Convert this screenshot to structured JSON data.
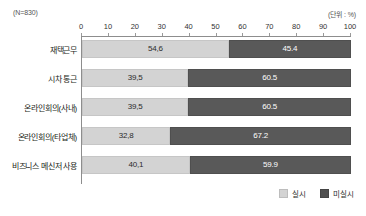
{
  "header": {
    "sample_note": "(N=830)",
    "unit_note": "(단위 : %)"
  },
  "legend": {
    "position": "bottom-right",
    "items": [
      {
        "label": "실시",
        "color": "#d3d3d3"
      },
      {
        "label": "미실시",
        "color": "#4f4f4f"
      }
    ]
  },
  "footnote": {
    "text": ""
  },
  "chart_data": {
    "type": "bar",
    "orientation": "horizontal",
    "stacked": true,
    "stack_total": 100,
    "title": "",
    "subtitle": "",
    "xlabel": "",
    "ylabel": "",
    "xlim": [
      0,
      100
    ],
    "xticks": [
      0,
      10,
      20,
      30,
      40,
      50,
      60,
      70,
      80,
      90,
      100
    ],
    "xtick_labels": [
      "0",
      "10",
      "20",
      "30",
      "40",
      "50",
      "60",
      "70",
      "80",
      "90",
      "100"
    ],
    "grid": false,
    "unit": "%",
    "sample_size": 830,
    "categories": [
      "재택근무",
      "시차 통근",
      "온라인회의(사내)",
      "온라인회의(타업체)",
      "비즈니스 메신저 사용"
    ],
    "series": [
      {
        "name": "실시",
        "color": "#d3d3d3",
        "values": [
          54.6,
          39.5,
          39.5,
          32.8,
          40.1
        ],
        "labels": [
          "54,6",
          "39,5",
          "39,5",
          "32,8",
          "40,1"
        ]
      },
      {
        "name": "미실시",
        "color": "#595959",
        "values": [
          45.4,
          60.5,
          60.5,
          67.2,
          59.9
        ],
        "labels": [
          "45.4",
          "60.5",
          "60.5",
          "67.2",
          "59.9"
        ]
      }
    ]
  }
}
